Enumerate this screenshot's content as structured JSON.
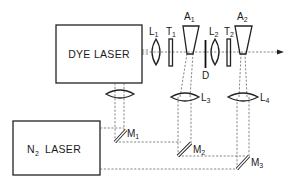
{
  "diagram": {
    "type": "optical-setup-schematic",
    "boxes": [
      {
        "id": "dye-laser",
        "label": "DYE LASER"
      },
      {
        "id": "n2-laser",
        "label_main": "N",
        "label_sub": "2",
        "label_rest": "LASER"
      }
    ],
    "components": {
      "L1": {
        "letter": "L",
        "sub": "1",
        "kind": "lens"
      },
      "T1": {
        "letter": "T",
        "sub": "1",
        "kind": "plate"
      },
      "A1": {
        "letter": "A",
        "sub": "1",
        "kind": "amplifier-cell"
      },
      "D": {
        "letter": "D",
        "sub": "",
        "kind": "aperture"
      },
      "L2": {
        "letter": "L",
        "sub": "2",
        "kind": "lens"
      },
      "T2": {
        "letter": "T",
        "sub": "2",
        "kind": "plate"
      },
      "A2": {
        "letter": "A",
        "sub": "2",
        "kind": "amplifier-cell"
      },
      "L3": {
        "letter": "L",
        "sub": "3",
        "kind": "cylindrical-lens"
      },
      "L4": {
        "letter": "L",
        "sub": "4",
        "kind": "cylindrical-lens"
      },
      "M1": {
        "letter": "M",
        "sub": "1",
        "kind": "mirror"
      },
      "M2": {
        "letter": "M",
        "sub": "2",
        "kind": "mirror"
      },
      "M3": {
        "letter": "M",
        "sub": "3",
        "kind": "mirror"
      }
    },
    "output_beam": "arrow-right",
    "colors": {
      "line": "#222222",
      "dash": "#555555",
      "background": "#ffffff"
    }
  }
}
